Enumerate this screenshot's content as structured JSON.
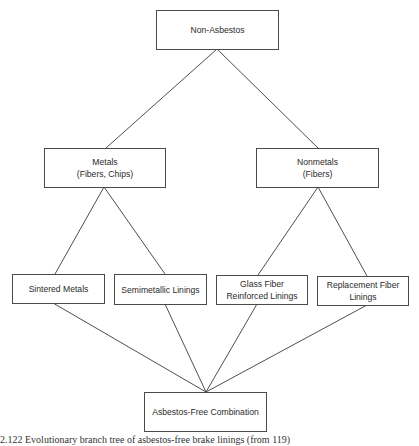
{
  "diagram": {
    "type": "tree",
    "root": {
      "id": "non_asbestos",
      "lines": [
        "Non-Asbestos"
      ]
    },
    "level2": [
      {
        "id": "metals",
        "lines": [
          "Metals",
          "(Fibers, Chips)"
        ]
      },
      {
        "id": "nonmetals",
        "lines": [
          "Nonmetals",
          "(Fibers)"
        ]
      }
    ],
    "level3": [
      {
        "id": "sintered_metals",
        "parent": "metals",
        "lines": [
          "Sintered Metals"
        ]
      },
      {
        "id": "semimetallic_linings",
        "parent": "metals",
        "lines": [
          "Semimetallic Linings"
        ]
      },
      {
        "id": "glass_fiber",
        "parent": "nonmetals",
        "lines": [
          "Glass Fiber",
          "Reinforced Linings"
        ]
      },
      {
        "id": "replacement_fiber",
        "parent": "nonmetals",
        "lines": [
          "Replacement Fiber",
          "Linings"
        ]
      }
    ],
    "sink": {
      "id": "asbestos_free_combination",
      "lines": [
        "Asbestos-Free Combination"
      ]
    },
    "edges": [
      [
        "non_asbestos",
        "metals"
      ],
      [
        "non_asbestos",
        "nonmetals"
      ],
      [
        "metals",
        "sintered_metals"
      ],
      [
        "metals",
        "semimetallic_linings"
      ],
      [
        "nonmetals",
        "glass_fiber"
      ],
      [
        "nonmetals",
        "replacement_fiber"
      ],
      [
        "sintered_metals",
        "asbestos_free_combination"
      ],
      [
        "semimetallic_linings",
        "asbestos_free_combination"
      ],
      [
        "glass_fiber",
        "asbestos_free_combination"
      ],
      [
        "replacement_fiber",
        "asbestos_free_combination"
      ]
    ]
  },
  "caption": {
    "text": "2.122  Evolutionary branch tree of asbestos-free brake linings (from 119)"
  }
}
